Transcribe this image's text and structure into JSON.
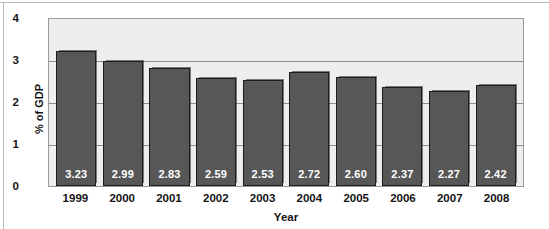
{
  "chart_data": {
    "type": "bar",
    "title": "",
    "subtitle": "",
    "xlabel": "Year",
    "ylabel": "% of GDP",
    "categories": [
      "1999",
      "2000",
      "2001",
      "2002",
      "2003",
      "2004",
      "2005",
      "2006",
      "2007",
      "2008"
    ],
    "values": [
      3.23,
      2.99,
      2.83,
      2.59,
      2.53,
      2.72,
      2.6,
      2.37,
      2.27,
      2.42
    ],
    "data_labels": [
      "3.23",
      "2.99",
      "2.83",
      "2.59",
      "2.53",
      "2.72",
      "2.60",
      "2.37",
      "2.27",
      "2.42"
    ],
    "ylim": [
      0,
      4
    ],
    "yticks": [
      0,
      1,
      2,
      3,
      4
    ],
    "ytick_labels": [
      "0",
      "1",
      "2",
      "3",
      "4"
    ],
    "grid": true,
    "gridlines_at": [
      1,
      2,
      3
    ],
    "legend": null,
    "series": [
      {
        "name": "% of GDP",
        "values": [
          3.23,
          2.99,
          2.83,
          2.59,
          2.53,
          2.72,
          2.6,
          2.37,
          2.27,
          2.42
        ]
      }
    ],
    "colors": {
      "bar_fill": "#575757",
      "bar_border": "#1c1c1c",
      "plot_background": "#eeeeee",
      "gridline": "#8d8d8d",
      "axis_text": "#141414",
      "data_label_text": "#ffffff",
      "figure_background": "#ffffff",
      "frame": "#9a9a9a"
    }
  }
}
